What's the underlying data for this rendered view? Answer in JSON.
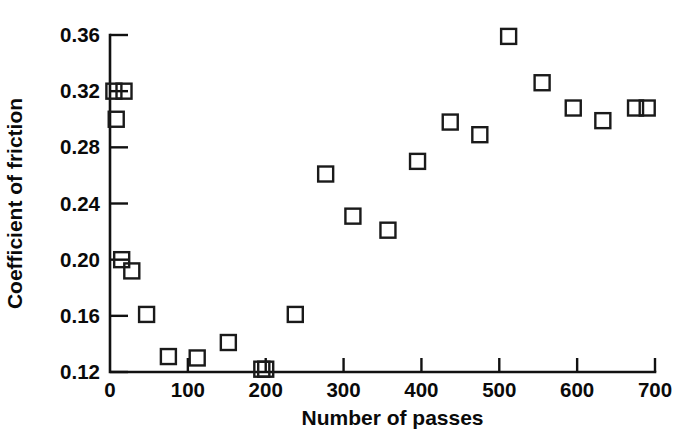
{
  "chart_data": {
    "type": "scatter",
    "title": "",
    "xlabel": "Number of passes",
    "ylabel": "Coefficient of friction",
    "xlim": [
      0,
      700
    ],
    "ylim": [
      0.12,
      0.36
    ],
    "xticks": [
      0,
      100,
      200,
      300,
      400,
      500,
      600,
      700
    ],
    "xtick_labels": [
      "0",
      "100",
      "200",
      "300",
      "400",
      "500",
      "600",
      "700"
    ],
    "yticks": [
      0.12,
      0.16,
      0.2,
      0.24,
      0.28,
      0.32,
      0.36
    ],
    "ytick_labels": [
      "0.12",
      "0.16",
      "0.20",
      "0.24",
      "0.28",
      "0.32",
      "0.36"
    ],
    "grid": false,
    "legend": null,
    "marker": "open-square",
    "marker_color": "#1a1a1a",
    "series": [
      {
        "name": "Coefficient of friction vs number of passes",
        "points": [
          [
            5,
            0.32
          ],
          [
            18,
            0.32
          ],
          [
            8,
            0.3
          ],
          [
            15,
            0.2
          ],
          [
            28,
            0.192
          ],
          [
            47,
            0.161
          ],
          [
            75,
            0.131
          ],
          [
            112,
            0.13
          ],
          [
            152,
            0.141
          ],
          [
            195,
            0.122
          ],
          [
            200,
            0.122
          ],
          [
            238,
            0.161
          ],
          [
            277,
            0.261
          ],
          [
            312,
            0.231
          ],
          [
            357,
            0.221
          ],
          [
            395,
            0.27
          ],
          [
            437,
            0.298
          ],
          [
            475,
            0.289
          ],
          [
            512,
            0.359
          ],
          [
            555,
            0.326
          ],
          [
            595,
            0.308
          ],
          [
            633,
            0.299
          ],
          [
            675,
            0.308
          ],
          [
            690,
            0.308
          ]
        ]
      }
    ]
  },
  "figure": {
    "background_color": "#ffffff",
    "axis_color": "#111111"
  }
}
